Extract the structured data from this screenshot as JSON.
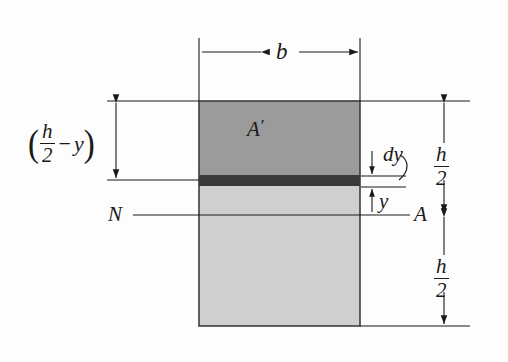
{
  "figure": {
    "background_color": "#fdfdfd",
    "line_color": "#1a1a1a"
  },
  "section": {
    "width_label": "b",
    "upper_area_label": "A",
    "upper_area_prime": "′",
    "upper_fill_color": "#9b9b9b",
    "lower_fill_color": "#cfcfcf",
    "strip_fill_color": "#3a3a3a",
    "outline_color": "#3c3c3c"
  },
  "axis": {
    "left_label": "N",
    "right_label": "A"
  },
  "dimensions": {
    "left_expr_open": "(",
    "left_expr_num": "h",
    "left_expr_den": "2",
    "left_expr_minus": "−",
    "left_expr_var": "y",
    "left_expr_close": ")",
    "upper_half_num": "h",
    "upper_half_den": "2",
    "lower_half_num": "h",
    "lower_half_den": "2"
  },
  "element": {
    "thickness_label": "dy",
    "distance_label": "y"
  }
}
